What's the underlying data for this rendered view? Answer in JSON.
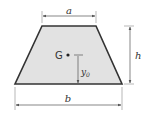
{
  "figure": {
    "shape": "trapezoid",
    "fill_color": "#e2e2e2",
    "stroke_color": "#333333",
    "dimension_color": "#555555",
    "labels": {
      "top_width": "a",
      "bottom_width": "b",
      "height": "h",
      "centroid": "G",
      "centroid_height": "y",
      "centroid_height_subscript": "0"
    }
  }
}
